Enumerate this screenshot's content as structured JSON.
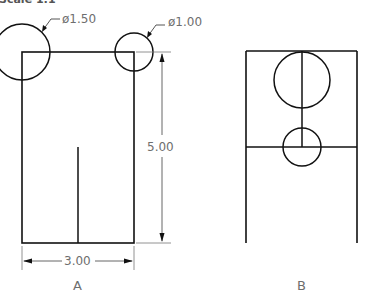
{
  "header": {
    "partial_text": "Scale 1:1"
  },
  "view_a": {
    "label": "A",
    "dimensions": {
      "large_circle_diameter": "ø1.50",
      "small_circle_diameter": "ø1.00",
      "height": "5.00",
      "width": "3.00"
    }
  },
  "view_b": {
    "label": "B"
  },
  "colors": {
    "object_line": "#111111",
    "dimension_line": "#555555",
    "text": "#6e6e6e"
  }
}
